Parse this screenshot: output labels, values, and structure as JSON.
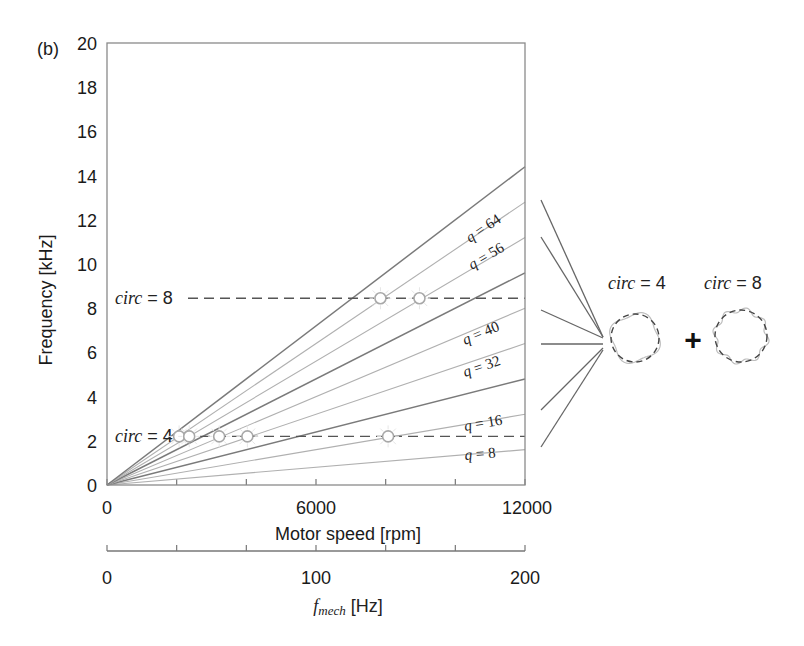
{
  "chart_data": {
    "type": "line",
    "panel_label": "(b)",
    "title": "",
    "xlabel": "Motor speed [rpm]",
    "ylabel": "Frequency [kHz]",
    "x2label_symbol": "f",
    "x2label_subscript": "mech",
    "x2label_unit": " [Hz]",
    "xlim": [
      0,
      12000
    ],
    "ylim": [
      0,
      20
    ],
    "x2lim": [
      0,
      200
    ],
    "x_ticks": [
      0,
      2000,
      4000,
      6000,
      8000,
      10000,
      12000
    ],
    "x_tick_labels": [
      "0",
      "6000",
      "12000"
    ],
    "x2_tick_labels": [
      "0",
      "100",
      "200"
    ],
    "y_tick_labels": [
      "0",
      "2",
      "4",
      "6",
      "8",
      "10",
      "12",
      "14",
      "16",
      "18",
      "20"
    ],
    "grid": false,
    "series_note": "Frequency = q * f_mech, f_mech = rpm/60",
    "series": [
      {
        "name": "q = 8",
        "q": 8,
        "labeled": true,
        "x": [
          0,
          12000
        ],
        "y": [
          0,
          1.6
        ]
      },
      {
        "name": "q = 16",
        "q": 16,
        "labeled": true,
        "x": [
          0,
          12000
        ],
        "y": [
          0,
          3.2
        ]
      },
      {
        "name": "q = 24",
        "q": 24,
        "labeled": false,
        "x": [
          0,
          12000
        ],
        "y": [
          0,
          4.8
        ]
      },
      {
        "name": "q = 32",
        "q": 32,
        "labeled": true,
        "x": [
          0,
          12000
        ],
        "y": [
          0,
          6.4
        ]
      },
      {
        "name": "q = 40",
        "q": 40,
        "labeled": true,
        "x": [
          0,
          12000
        ],
        "y": [
          0,
          8.0
        ]
      },
      {
        "name": "q = 48",
        "q": 48,
        "labeled": false,
        "x": [
          0,
          12000
        ],
        "y": [
          0,
          9.6
        ]
      },
      {
        "name": "q = 56",
        "q": 56,
        "labeled": true,
        "x": [
          0,
          12000
        ],
        "y": [
          0,
          11.2
        ]
      },
      {
        "name": "q = 64",
        "q": 64,
        "labeled": true,
        "x": [
          0,
          12000
        ],
        "y": [
          0,
          12.8
        ]
      },
      {
        "name": "q = 72",
        "q": 72,
        "labeled": false,
        "x": [
          0,
          12000
        ],
        "y": [
          0,
          14.4
        ]
      }
    ],
    "horizontal_lines": [
      {
        "label_prefix": "circ",
        "label_value": " = 8",
        "y": 8.45
      },
      {
        "label_prefix": "circ",
        "label_value": " = 4",
        "y": 2.2
      }
    ],
    "intersection_markers": [
      {
        "circ": 8,
        "rpm": 7850,
        "freq": 8.45
      },
      {
        "circ": 8,
        "rpm": 8970,
        "freq": 8.45
      },
      {
        "circ": 4,
        "rpm": 2070,
        "freq": 2.2
      },
      {
        "circ": 4,
        "rpm": 2360,
        "freq": 2.2
      },
      {
        "circ": 4,
        "rpm": 3220,
        "freq": 2.2
      },
      {
        "circ": 4,
        "rpm": 4030,
        "freq": 2.2
      },
      {
        "circ": 4,
        "rpm": 8070,
        "freq": 2.2
      }
    ],
    "annotations": {
      "mode_shapes": [
        {
          "label_prefix": "circ",
          "label_value": " = 4"
        },
        {
          "label_prefix": "circ",
          "label_value": " = 8"
        }
      ],
      "combine_symbol": "+"
    }
  }
}
